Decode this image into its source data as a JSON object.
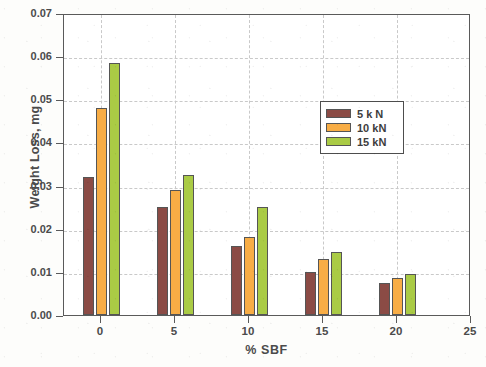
{
  "chart_data": {
    "type": "bar",
    "title": "",
    "xlabel": "% SBF",
    "ylabel": "Weight Loss, mg",
    "categories": [
      "0",
      "5",
      "10",
      "15",
      "20"
    ],
    "x": [
      0,
      5,
      10,
      15,
      20
    ],
    "xlim": [
      -2.5,
      25
    ],
    "ylim": [
      0.0,
      0.07
    ],
    "xticks": [
      "0",
      "5",
      "10",
      "15",
      "20",
      "25"
    ],
    "yticks": [
      "0.00",
      "0.01",
      "0.02",
      "0.03",
      "0.04",
      "0.05",
      "0.06",
      "0.07"
    ],
    "grid": true,
    "legend_position": "upper right inside",
    "series": [
      {
        "name": "5 k N",
        "color": "#8b4b45",
        "values": [
          0.032,
          0.025,
          0.016,
          0.01,
          0.0074
        ]
      },
      {
        "name": "10 kN",
        "color": "#f8ad45",
        "values": [
          0.048,
          0.029,
          0.018,
          0.013,
          0.0086
        ]
      },
      {
        "name": "15 kN",
        "color": "#aacb45",
        "values": [
          0.0585,
          0.0325,
          0.025,
          0.0147,
          0.0095
        ]
      }
    ]
  },
  "legend": {
    "items": [
      {
        "label": "5 k N",
        "color": "#8b4b45"
      },
      {
        "label": "10 kN",
        "color": "#f8ad45"
      },
      {
        "label": "15 kN",
        "color": "#aacb45"
      }
    ]
  },
  "axes": {
    "y_title": "Weight Loss, mg",
    "x_title": "% SBF"
  }
}
